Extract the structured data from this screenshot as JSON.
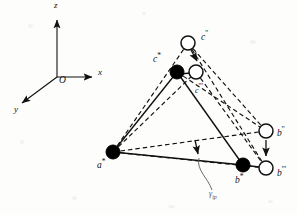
{
  "figure": {
    "background_color": "#fdfdfc",
    "stroke_color": "#111111",
    "node_fill_solid": "#000000",
    "node_fill_open": "#ffffff"
  },
  "axes": {
    "origin_label": "O",
    "z_label": "z",
    "x_label": "x",
    "y_label": "y",
    "origin": {
      "x": 57,
      "y": 77
    },
    "z_tip": {
      "x": 57,
      "y": 17
    },
    "x_tip": {
      "x": 97,
      "y": 77
    },
    "y_tip": {
      "x": 17,
      "y": 107
    }
  },
  "nodes": [
    {
      "id": "a-star",
      "label": "a",
      "marks": "*",
      "type": "solid",
      "x": 113,
      "y": 152,
      "r": 7.0,
      "label_x": 98,
      "label_y": 160
    },
    {
      "id": "b-star",
      "label": "b",
      "marks": "*",
      "type": "solid",
      "x": 243,
      "y": 165,
      "r": 7.0,
      "label_x": 236,
      "label_y": 178
    },
    {
      "id": "c-star",
      "label": "c",
      "marks": "*",
      "type": "solid",
      "x": 177,
      "y": 72,
      "r": 7.0,
      "label_x": 155,
      "label_y": 58
    },
    {
      "id": "b-prime2",
      "label": "b",
      "marks": "''",
      "type": "open",
      "x": 266,
      "y": 131,
      "r": 7.0,
      "label_x": 277,
      "label_y": 131
    },
    {
      "id": "b-prime3",
      "label": "b",
      "marks": "'''",
      "type": "open",
      "x": 266,
      "y": 168,
      "r": 7.0,
      "label_x": 277,
      "label_y": 172
    },
    {
      "id": "c-prime2",
      "label": "c",
      "marks": "''",
      "type": "open",
      "x": 188,
      "y": 43,
      "r": 7.0,
      "label_x": 201,
      "label_y": 36
    },
    {
      "id": "c-prime3",
      "label": "c",
      "marks": "'''",
      "type": "open",
      "x": 196,
      "y": 72,
      "r": 7.0,
      "label_x": 197,
      "label_y": 88
    }
  ],
  "angle_annotation": {
    "label": "γ",
    "subscript": "ip",
    "label_x": 212,
    "label_y": 196
  },
  "edges_solid": [
    {
      "from": "a-star",
      "to": "b-star"
    },
    {
      "from": "a-star",
      "to": "c-star"
    },
    {
      "from": "c-star",
      "to": "b-star"
    }
  ],
  "edges_dashed": [
    {
      "from": "a-star",
      "to": "c-prime2"
    },
    {
      "from": "a-star",
      "to": "c-prime3"
    },
    {
      "from": "a-star",
      "to": "b-prime2"
    },
    {
      "from": "a-star",
      "to": "b-prime3"
    },
    {
      "from": "c-prime2",
      "to": "b-prime2"
    },
    {
      "from": "c-prime2",
      "to": "b-prime3"
    },
    {
      "from": "c-prime3",
      "to": "b-prime3"
    },
    {
      "from": "c-star",
      "to": "b-prime2"
    }
  ],
  "shift_arrows": [
    {
      "name": "c-shift-arrow",
      "from": {
        "x": 192,
        "y": 50
      },
      "to": {
        "x": 198,
        "y": 64
      }
    },
    {
      "name": "b-shift-arrow",
      "from": {
        "x": 266,
        "y": 140
      },
      "to": {
        "x": 266,
        "y": 159
      }
    },
    {
      "name": "gamma-angle-arrow",
      "from": {
        "x": 196,
        "y": 141
      },
      "to": {
        "x": 199,
        "y": 157
      }
    }
  ]
}
